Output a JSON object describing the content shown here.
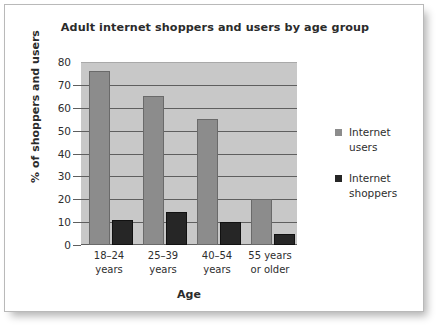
{
  "chart_data": {
    "type": "bar",
    "title": "Adult internet shoppers and users by age group",
    "xlabel": "Age",
    "ylabel": "% of shoppers and users",
    "categories": [
      "18–24\nyears",
      "25–39\nyears",
      "40–54\nyears",
      "55 years\nor older"
    ],
    "category_labels": [
      {
        "line1": "18–24",
        "line2": "years"
      },
      {
        "line1": "25–39",
        "line2": "years"
      },
      {
        "line1": "40–54",
        "line2": "years"
      },
      {
        "line1": "55 years",
        "line2": "or older"
      }
    ],
    "series": [
      {
        "name": "Internet users",
        "color": "#8c8c8c",
        "values": [
          76,
          65,
          55,
          20
        ]
      },
      {
        "name": "Internet shoppers",
        "color": "#262626",
        "values": [
          11,
          14.5,
          10,
          5
        ]
      }
    ],
    "ylim": [
      0,
      80
    ],
    "yticks": [
      0,
      10,
      20,
      30,
      40,
      50,
      60,
      70,
      80
    ],
    "ytick_labels": [
      "0",
      "10",
      "20",
      "30",
      "40",
      "50",
      "60",
      "70",
      "80"
    ],
    "grid": true,
    "legend_position": "right",
    "plot_background": "#c8c8c8",
    "gridline_color": "#5f5f5f"
  },
  "legend": {
    "entries": [
      {
        "label_line1": "Internet",
        "label_line2": "users",
        "color": "#8c8c8c"
      },
      {
        "label_line1": "Internet",
        "label_line2": "shoppers",
        "color": "#262626"
      }
    ]
  }
}
